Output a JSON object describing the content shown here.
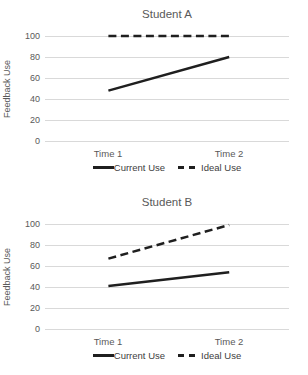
{
  "colors": {
    "line": "#1f1f1f",
    "gridline": "#d9d9d9",
    "axis_text": "#595959",
    "legend_text": "#404040",
    "background": "#ffffff"
  },
  "chart_data": [
    {
      "type": "line",
      "title": "Student A",
      "ylabel": "Feedback Use",
      "xlabel": "",
      "categories": [
        "Time 1",
        "Time 2"
      ],
      "yticks": [
        0,
        20,
        40,
        60,
        80,
        100
      ],
      "ylim": [
        0,
        100
      ],
      "grid": true,
      "legend_position": "bottom",
      "series": [
        {
          "name": "Current Use",
          "style": "solid",
          "values": [
            48,
            80
          ]
        },
        {
          "name": "Ideal Use",
          "style": "dashed",
          "values": [
            100,
            100
          ]
        }
      ]
    },
    {
      "type": "line",
      "title": "Student B",
      "ylabel": "Feedback Use",
      "xlabel": "",
      "categories": [
        "Time 1",
        "Time 2"
      ],
      "yticks": [
        0,
        20,
        40,
        60,
        80,
        100
      ],
      "ylim": [
        0,
        100
      ],
      "grid": true,
      "legend_position": "bottom",
      "series": [
        {
          "name": "Current Use",
          "style": "solid",
          "values": [
            41,
            54
          ]
        },
        {
          "name": "Ideal Use",
          "style": "dashed",
          "values": [
            67,
            99
          ]
        }
      ]
    }
  ]
}
